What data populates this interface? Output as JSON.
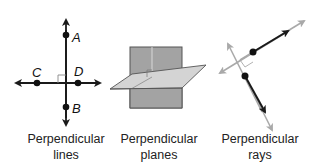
{
  "figures": [
    {
      "id": "perpendicular-lines",
      "caption": [
        "Perpendicular",
        "lines"
      ],
      "points": [
        {
          "label": "A",
          "x": 66,
          "y": 35
        },
        {
          "label": "B",
          "x": 66,
          "y": 107
        },
        {
          "label": "C",
          "x": 37,
          "y": 83
        },
        {
          "label": "D",
          "x": 78,
          "y": 83
        }
      ]
    },
    {
      "id": "perpendicular-planes",
      "caption": [
        "Perpendicular",
        "planes"
      ]
    },
    {
      "id": "perpendicular-rays",
      "caption": [
        "Perpendicular",
        "rays"
      ]
    }
  ],
  "colors": {
    "line": "#1a1a1a",
    "gray_line": "#a9a9a9",
    "vertical_plane": "#a3a3a3",
    "horizontal_plane": "#d4d4d4",
    "plane_edge": "#555555"
  }
}
